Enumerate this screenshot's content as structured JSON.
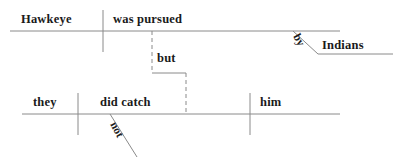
{
  "diagram": {
    "type": "reed-kellogg-sentence-diagram",
    "sentence": "Hawkeye was pursued by Indians, but they did not catch him.",
    "line_color": "#8a8a8a",
    "text_color": "#1a1a1a",
    "background_color": "#ffffff",
    "clauses": [
      {
        "id": "clause-top",
        "subject": "Hawkeye",
        "predicate": "was pursued",
        "modifier_preposition": "by",
        "object_of_preposition": "Indians"
      },
      {
        "id": "clause-bottom",
        "subject": "they",
        "predicate": "did catch",
        "adverb": "not",
        "direct_object": "him"
      }
    ],
    "conjunction": "but",
    "labels": {
      "hawkeye": "Hawkeye",
      "was_pursued": "was pursued",
      "by": "by",
      "indians": "Indians",
      "but": "but",
      "they": "they",
      "did_catch": "did catch",
      "not": "not",
      "him": "him"
    }
  }
}
